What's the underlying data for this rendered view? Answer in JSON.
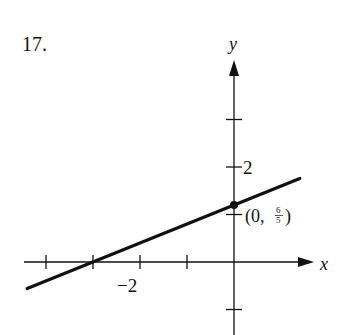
{
  "problem_number": "17.",
  "chart_data": {
    "type": "line",
    "title": "",
    "xlabel": "x",
    "ylabel": "y",
    "xlim": [
      -4.5,
      1.5
    ],
    "ylim": [
      -1.5,
      4
    ],
    "grid": false,
    "x_ticks": [
      -4,
      -3,
      -2,
      -1
    ],
    "x_tick_labels": [
      {
        "value": -2,
        "label": "−2"
      }
    ],
    "y_ticks": [
      -1,
      1,
      2,
      3
    ],
    "y_tick_labels": [
      {
        "value": 2,
        "label": "2"
      }
    ],
    "series": [
      {
        "name": "line",
        "slope": 0.4,
        "intercept": 1.2,
        "x": [
          -4.4,
          1.4
        ],
        "y": [
          -0.56,
          1.76
        ]
      }
    ],
    "annotations": [
      {
        "x": 0,
        "y": 1.2,
        "label_prefix": "(0, ",
        "label_num": "6",
        "label_den": "5",
        "label_suffix": ")",
        "marker": "dot"
      }
    ],
    "x_intercept": -3
  }
}
